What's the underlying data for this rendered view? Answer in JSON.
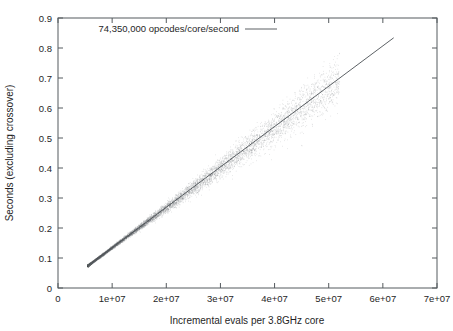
{
  "chart_data": {
    "type": "scatter",
    "title": "",
    "xlabel": "Incremental evals per 3.8GHz core",
    "ylabel": "Seconds (excluding crossover)",
    "xlim": [
      0,
      70000000
    ],
    "ylim": [
      0,
      0.9
    ],
    "grid": false,
    "legend_position": "top-left-inside",
    "legend": [
      {
        "label": "74,350,000 opcodes/core/second",
        "style": "line",
        "color": "#4a4f54"
      }
    ],
    "xticks": [
      0,
      10000000,
      20000000,
      30000000,
      40000000,
      50000000,
      60000000,
      70000000
    ],
    "xtick_labels": [
      "0",
      "1e+07",
      "2e+07",
      "3e+07",
      "4e+07",
      "5e+07",
      "6e+07",
      "7e+07"
    ],
    "yticks": [
      0,
      0.1,
      0.2,
      0.3,
      0.4,
      0.5,
      0.6,
      0.7,
      0.8,
      0.9
    ],
    "ytick_labels": [
      "0",
      "0.1",
      "0.2",
      "0.3",
      "0.4",
      "0.5",
      "0.6",
      "0.7",
      "0.8",
      "0.9"
    ],
    "series": [
      {
        "name": "measurements",
        "type": "scatter",
        "marker": "dot",
        "color": "#6b7075",
        "point_count": 9000,
        "x_range": [
          5500000,
          52000000
        ],
        "y_range": [
          0.075,
          0.62
        ],
        "description": "Dense fan-shaped point cloud tightly following the linear trend at low x and spreading wider above x=2e+07"
      },
      {
        "name": "74,350,000 opcodes/core/second",
        "type": "line",
        "color": "#4a4f54",
        "slope_per_unit_x": 1.3450572e-08,
        "x": [
          5500000,
          62000000
        ],
        "y": [
          0.074,
          0.8339
        ]
      }
    ],
    "fit_line_endpoints": {
      "x1": 5500000,
      "y1": 0.074,
      "x2": 62000000,
      "y2": 0.834
    },
    "colors": {
      "axis": "#555a5e",
      "line": "#4a4f54",
      "points": "#6b7075",
      "text": "#262626",
      "background": "#ffffff"
    }
  }
}
